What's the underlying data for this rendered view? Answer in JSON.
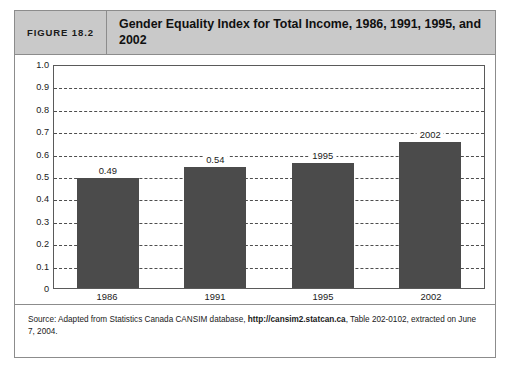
{
  "figure": {
    "number_label": "FIGURE 18.2",
    "title": "Gender Equality Index for Total Income, 1986, 1991, 1995, and 2002",
    "source_prefix": "Source: Adapted from Statistics Canada CANSIM database, ",
    "source_url": "http://cansim2.statcan.ca",
    "source_suffix": ", Table 202-0102, extracted on June 7, 2004."
  },
  "colors": {
    "bar": "#4b4b4b",
    "header_background": "#c9c9c9",
    "border": "#8c8c8c",
    "gridline": "#4e4e4e"
  },
  "chart_data": {
    "type": "bar",
    "title": "Gender Equality Index for Total Income, 1986, 1991, 1995, and 2002",
    "xlabel": "",
    "ylabel": "",
    "categories": [
      "1986",
      "1991",
      "1995",
      "2002"
    ],
    "values": [
      0.49,
      0.54,
      0.56,
      0.65
    ],
    "bar_labels": [
      "0.49",
      "0.54",
      "1995",
      "2002"
    ],
    "ylim": [
      0,
      1.0
    ],
    "ytick_values": [
      1.0,
      0.9,
      0.8,
      0.7,
      0.6,
      0.5,
      0.4,
      0.3,
      0.2,
      0.1,
      0
    ],
    "ytick_labels": [
      "1.0",
      "0.9",
      "0.8",
      "0.7",
      "0.6",
      "0.5",
      "0.4",
      "0.3",
      "0.2",
      "0.1",
      "0"
    ],
    "gridlines_at": [
      0.9,
      0.8,
      0.7,
      0.6,
      0.5,
      0.4,
      0.3,
      0.2,
      0.1
    ],
    "grid": true,
    "grid_style": "dashed",
    "legend": null,
    "legend_position": "none",
    "series": [
      {
        "name": "Gender Equality Index for Total Income",
        "values": [
          0.49,
          0.54,
          0.56,
          0.65
        ]
      }
    ]
  }
}
